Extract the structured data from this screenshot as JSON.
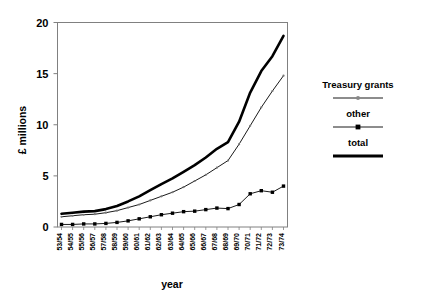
{
  "chart_data": {
    "type": "line",
    "title": "",
    "xlabel": "year",
    "ylabel": "£ millions",
    "ylim": [
      0,
      20
    ],
    "yticks": [
      0,
      5,
      10,
      15,
      20
    ],
    "grid": false,
    "legend_position": "right",
    "categories": [
      "53/54",
      "54/55",
      "55/56",
      "56/57",
      "57/58",
      "58/59",
      "59/60",
      "60/61",
      "61/62",
      "62/63",
      "63/64",
      "64/65",
      "65/66",
      "66/67",
      "67/68",
      "68/69",
      "69/70",
      "70/71",
      "71/72",
      "72/73",
      "73/74"
    ],
    "series": [
      {
        "name": "Treasury grants",
        "marker": "small-circle",
        "line_width": "thin",
        "color": "#000000",
        "values": [
          1.0,
          1.1,
          1.2,
          1.25,
          1.4,
          1.6,
          1.9,
          2.2,
          2.6,
          3.0,
          3.4,
          3.9,
          4.5,
          5.1,
          5.8,
          6.5,
          8.1,
          9.9,
          11.7,
          13.3,
          14.8
        ]
      },
      {
        "name": "other",
        "marker": "filled-square",
        "line_width": "thin",
        "color": "#000000",
        "values": [
          0.25,
          0.25,
          0.3,
          0.3,
          0.35,
          0.45,
          0.6,
          0.8,
          1.0,
          1.2,
          1.35,
          1.5,
          1.55,
          1.7,
          1.85,
          1.8,
          2.2,
          3.25,
          3.55,
          3.4,
          4.0
        ]
      },
      {
        "name": "total",
        "marker": "none",
        "line_width": "thick",
        "color": "#000000",
        "values": [
          1.3,
          1.4,
          1.5,
          1.55,
          1.75,
          2.05,
          2.5,
          3.0,
          3.6,
          4.2,
          4.75,
          5.4,
          6.05,
          6.8,
          7.65,
          8.3,
          10.3,
          13.15,
          15.25,
          16.7,
          18.7
        ]
      }
    ]
  },
  "legend": {
    "entries": [
      {
        "label": "Treasury grants"
      },
      {
        "label": "other"
      },
      {
        "label": "total"
      }
    ]
  },
  "axes": {
    "y_label": "£ millions",
    "x_label": "year",
    "y_tick_labels": [
      "0",
      "5",
      "10",
      "15",
      "20"
    ]
  }
}
